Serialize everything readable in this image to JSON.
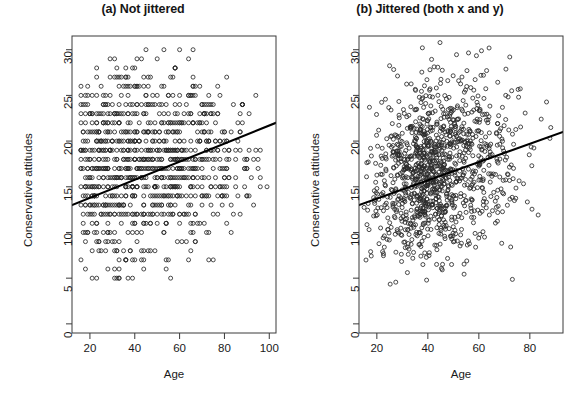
{
  "figure": {
    "width": 573,
    "height": 399,
    "background": "#ffffff",
    "foreground": "#1a1a1a"
  },
  "chart_data": [
    {
      "type": "scatter",
      "panel_id": "a",
      "title": "(a) Not jittered",
      "xlabel": "Age",
      "ylabel": "Conservative attitudes",
      "xlim": [
        12,
        103
      ],
      "ylim": [
        -1,
        31.5
      ],
      "xticks": [
        20,
        40,
        60,
        80,
        100
      ],
      "yticks": [
        0,
        5,
        10,
        15,
        20,
        25,
        30
      ],
      "grid": false,
      "legend": null,
      "marker": "open-circle",
      "marker_size_px": 4,
      "n_points": 1200,
      "notes": "Integer-valued Age and Conservative attitudes plotted without jitter, producing heavy overplotting in discrete horizontal rows.",
      "regression_line": {
        "type": "linear-fit",
        "x_start": 12,
        "y_start": 13.0,
        "x_end": 103,
        "y_end": 22.0,
        "slope": 0.099,
        "intercept": 11.81,
        "color": "#000000",
        "width_px": 2.2
      },
      "y_row_levels": [
        5,
        6,
        7,
        8,
        9,
        10,
        11,
        12,
        13,
        14,
        15,
        16,
        17,
        18,
        19,
        20,
        21,
        22,
        23,
        24,
        25,
        26,
        27,
        28,
        29,
        30
      ],
      "row_density": [
        14,
        16,
        22,
        28,
        34,
        42,
        52,
        66,
        78,
        92,
        104,
        116,
        122,
        118,
        108,
        96,
        84,
        70,
        56,
        44,
        32,
        22,
        16,
        10,
        6,
        4
      ],
      "row_x_spread": [
        62,
        66,
        70,
        74,
        78,
        82,
        84,
        86,
        88,
        90,
        90,
        90,
        90,
        88,
        86,
        84,
        82,
        78,
        74,
        70,
        64,
        58,
        52,
        44,
        36,
        30
      ]
    },
    {
      "type": "scatter",
      "panel_id": "b",
      "title": "(b) Jittered (both x and y)",
      "xlabel": "Age",
      "ylabel": "Conservative attitudes",
      "xlim": [
        13,
        93
      ],
      "ylim": [
        -1,
        31.5
      ],
      "xticks": [
        20,
        40,
        60,
        80
      ],
      "yticks": [
        0,
        5,
        10,
        15,
        20,
        25,
        30
      ],
      "grid": false,
      "legend": null,
      "marker": "open-circle",
      "marker_size_px": 4,
      "n_points": 1200,
      "notes": "Same data with random jitter added to both x and y, revealing the density cloud.",
      "regression_line": {
        "type": "linear-fit",
        "x_start": 13,
        "y_start": 13.0,
        "x_end": 93,
        "y_end": 21.0,
        "slope": 0.1,
        "intercept": 11.7,
        "color": "#000000",
        "width_px": 2.2
      },
      "cloud": {
        "x_mode": 36,
        "y_mode": 16,
        "x_range": [
          15,
          92
        ],
        "y_range": [
          4,
          31
        ]
      }
    }
  ]
}
